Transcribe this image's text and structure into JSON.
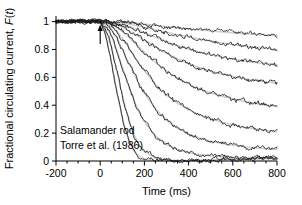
{
  "figure": {
    "name": "photoreceptor-flash-response-family",
    "background": "#ffffff"
  },
  "annotations": {
    "line1": "Salamander rod",
    "line2": "Torre et al. (1986)",
    "flash_marker_name": "flash-onset-arrow",
    "flash_marker_time_ms": 0
  },
  "axes": {
    "x": {
      "label": "Time (ms)",
      "ticks": [
        -200,
        0,
        200,
        400,
        600,
        800
      ],
      "tick_labels": [
        "-200",
        "0",
        "200",
        "400",
        "600",
        "800"
      ],
      "minor_step": 50,
      "range": [
        -200,
        800
      ]
    },
    "y": {
      "label_prefix": "Fractional circulating current, ",
      "label_italic_f": "F",
      "label_paren_open": "(",
      "label_italic_t": "t",
      "label_paren_close": ")",
      "ticks": [
        0,
        0.2,
        0.4,
        0.6,
        0.8,
        1
      ],
      "tick_labels": [
        "0",
        "0.2",
        "0.4",
        "0.6",
        "0.8",
        "1"
      ],
      "range": [
        0,
        1.04
      ]
    }
  },
  "colors": {
    "data_trace": "#1a1a1a",
    "theory_trace": "#cfcfcf",
    "axis": "#000000"
  },
  "chart_data": {
    "type": "line",
    "title": "",
    "xlabel": "Time (ms)",
    "ylabel": "Fractional circulating current, F(t)",
    "xlim": [
      -200,
      800
    ],
    "ylim": [
      0,
      1.04
    ],
    "grid": false,
    "legend": false,
    "x_unit": "ms",
    "x": [
      -200,
      -150,
      -100,
      -50,
      0,
      25,
      50,
      75,
      100,
      125,
      150,
      175,
      200,
      250,
      300,
      350,
      400,
      450,
      500,
      550,
      600,
      650,
      700,
      750,
      800
    ],
    "series": [
      {
        "name": "flash-1-dimmest",
        "values": [
          1.0,
          1.0,
          1.0,
          1.0,
          1.0,
          1.0,
          0.999,
          0.998,
          0.996,
          0.993,
          0.99,
          0.986,
          0.982,
          0.973,
          0.964,
          0.956,
          0.948,
          0.94,
          0.933,
          0.926,
          0.919,
          0.913,
          0.908,
          0.903,
          0.9
        ]
      },
      {
        "name": "flash-2",
        "values": [
          1.0,
          1.0,
          1.0,
          1.0,
          1.0,
          0.999,
          0.997,
          0.994,
          0.989,
          0.983,
          0.976,
          0.968,
          0.959,
          0.941,
          0.923,
          0.906,
          0.89,
          0.875,
          0.861,
          0.848,
          0.836,
          0.825,
          0.815,
          0.806,
          0.798
        ]
      },
      {
        "name": "flash-3",
        "values": [
          1.0,
          1.0,
          1.0,
          1.0,
          1.0,
          0.998,
          0.994,
          0.987,
          0.977,
          0.965,
          0.951,
          0.936,
          0.92,
          0.888,
          0.857,
          0.829,
          0.804,
          0.782,
          0.763,
          0.746,
          0.731,
          0.718,
          0.707,
          0.697,
          0.69
        ]
      },
      {
        "name": "flash-4",
        "values": [
          1.0,
          1.0,
          1.0,
          1.0,
          1.0,
          0.997,
          0.99,
          0.977,
          0.96,
          0.939,
          0.916,
          0.892,
          0.867,
          0.818,
          0.773,
          0.733,
          0.699,
          0.67,
          0.645,
          0.624,
          0.606,
          0.591,
          0.578,
          0.567,
          0.558
        ]
      },
      {
        "name": "flash-5",
        "values": [
          1.0,
          1.0,
          1.0,
          1.0,
          1.0,
          0.994,
          0.982,
          0.96,
          0.93,
          0.895,
          0.857,
          0.818,
          0.78,
          0.708,
          0.646,
          0.594,
          0.551,
          0.516,
          0.488,
          0.464,
          0.445,
          0.428,
          0.414,
          0.402,
          0.392
        ]
      },
      {
        "name": "flash-6",
        "values": [
          1.0,
          1.0,
          1.0,
          1.0,
          1.0,
          0.99,
          0.968,
          0.93,
          0.88,
          0.822,
          0.762,
          0.703,
          0.648,
          0.551,
          0.474,
          0.414,
          0.367,
          0.33,
          0.301,
          0.278,
          0.259,
          0.243,
          0.23,
          0.219,
          0.209
        ]
      },
      {
        "name": "flash-7",
        "values": [
          1.0,
          1.0,
          1.0,
          1.0,
          1.0,
          0.983,
          0.944,
          0.882,
          0.803,
          0.718,
          0.634,
          0.556,
          0.487,
          0.374,
          0.293,
          0.235,
          0.194,
          0.164,
          0.142,
          0.126,
          0.113,
          0.103,
          0.095,
          0.088,
          0.083
        ]
      },
      {
        "name": "flash-8",
        "values": [
          1.0,
          1.0,
          1.0,
          1.0,
          1.0,
          0.97,
          0.9,
          0.796,
          0.674,
          0.554,
          0.446,
          0.355,
          0.282,
          0.18,
          0.119,
          0.082,
          0.059,
          0.045,
          0.036,
          0.03,
          0.027,
          0.025,
          0.023,
          0.022,
          0.022
        ]
      },
      {
        "name": "flash-9",
        "values": [
          1.0,
          1.0,
          1.0,
          1.0,
          1.0,
          0.945,
          0.82,
          0.65,
          0.472,
          0.318,
          0.2,
          0.12,
          0.07,
          0.022,
          0.008,
          0.004,
          0.003,
          0.004,
          0.006,
          0.008,
          0.01,
          0.012,
          0.014,
          0.016,
          0.018
        ]
      },
      {
        "name": "flash-10-brightest",
        "values": [
          1.0,
          1.0,
          1.0,
          1.0,
          1.0,
          0.9,
          0.715,
          0.5,
          0.305,
          0.165,
          0.08,
          0.035,
          0.014,
          0.002,
          0.0,
          0.0,
          0.002,
          0.005,
          0.008,
          0.011,
          0.014,
          0.016,
          0.018,
          0.02,
          0.021
        ]
      }
    ]
  }
}
